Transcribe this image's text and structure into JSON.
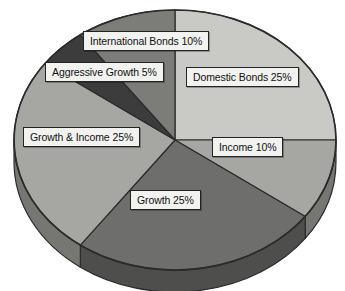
{
  "chart_data": {
    "type": "pie",
    "title": "",
    "subtitle": "",
    "xlabel": "",
    "ylabel": "",
    "legend_position": "none",
    "grid": false,
    "three_d": true,
    "start_angle_deg": 0,
    "direction": "clockwise",
    "units": "percent",
    "categories": [
      "Domestic Bonds",
      "Income",
      "Growth",
      "Growth & Income",
      "Aggressive Growth",
      "International Bonds"
    ],
    "values": [
      25,
      10,
      25,
      25,
      5,
      10
    ],
    "labels": [
      "Domestic Bonds 25%",
      "Income 10%",
      "Growth 25%",
      "Growth & Income 25%",
      "Aggressive Growth 5%",
      "International Bonds 10%"
    ],
    "slice_colors": [
      "#c9c9c6",
      "#a6a6a2",
      "#6e6e6c",
      "#a6a6a2",
      "#3c3c3c",
      "#7c7c79"
    ],
    "side_colors": [
      "#8f8f8c",
      "#767672",
      "#4e4e4c",
      "#767672",
      "#2a2a2a",
      "#585856"
    ]
  },
  "slices": [
    {
      "name": "domestic-bonds",
      "label": "Domestic Bonds 25%",
      "value": 25,
      "color": "#c9c9c6",
      "side_color": "#8f8f8c",
      "start": 0,
      "end": 90,
      "label_x": 186,
      "label_y": 67
    },
    {
      "name": "income",
      "label": "Income 10%",
      "value": 10,
      "color": "#a6a6a2",
      "side_color": "#767672",
      "start": 90,
      "end": 126,
      "label_x": 212,
      "label_y": 137
    },
    {
      "name": "growth",
      "label": "Growth 25%",
      "value": 25,
      "color": "#6e6e6c",
      "side_color": "#4e4e4c",
      "start": 126,
      "end": 216,
      "label_x": 130,
      "label_y": 190
    },
    {
      "name": "growth-and-income",
      "label": "Growth & Income 25%",
      "value": 25,
      "color": "#a6a6a2",
      "side_color": "#767672",
      "start": 216,
      "end": 306,
      "label_x": 23,
      "label_y": 127
    },
    {
      "name": "aggressive-growth",
      "label": "Aggressive Growth 5%",
      "value": 5,
      "color": "#3c3c3c",
      "side_color": "#2a2a2a",
      "start": 306,
      "end": 324,
      "label_x": 45,
      "label_y": 62
    },
    {
      "name": "international-bonds",
      "label": "International Bonds 10%",
      "value": 10,
      "color": "#7c7c79",
      "side_color": "#585856",
      "start": 324,
      "end": 360,
      "label_x": 83,
      "label_y": 31
    }
  ],
  "geometry": {
    "cx": 175,
    "cy": 140,
    "rx": 161,
    "ry": 130,
    "depth": 22
  },
  "colors": {
    "background": "#ffffff",
    "outline": "#2b2b2b",
    "label_bg": "#f2f2f0",
    "label_border": "#232323",
    "label_text": "#111111"
  }
}
